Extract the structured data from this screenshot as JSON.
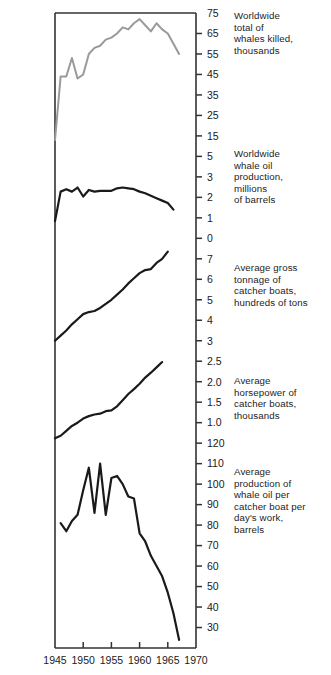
{
  "chart_data": {
    "type": "line",
    "title": "",
    "subtitle": "",
    "xlabel": "",
    "ylabel": "",
    "grid": false,
    "legend_position": "right",
    "x_axis": {
      "ticks": [
        1945,
        1950,
        1955,
        1960,
        1965,
        1970
      ],
      "range": [
        1945,
        1970
      ]
    },
    "panels": [
      {
        "name": "whales-killed",
        "caption": "Worldwide\ntotal of\nwhales killed,\nthousands",
        "color": "#9a9a9a",
        "y_ticks": [
          75,
          65,
          55,
          45,
          35,
          25,
          15
        ],
        "ylim": [
          10,
          75
        ],
        "x": [
          1945,
          1946,
          1947,
          1948,
          1949,
          1950,
          1951,
          1952,
          1953,
          1954,
          1955,
          1956,
          1957,
          1958,
          1959,
          1960,
          1961,
          1962,
          1963,
          1964,
          1965,
          1966,
          1967
        ],
        "values": [
          13,
          44,
          44,
          53,
          43,
          45,
          55,
          58,
          59,
          62,
          63,
          65,
          68,
          67,
          70,
          72,
          69,
          66,
          70,
          67,
          65,
          60,
          55
        ]
      },
      {
        "name": "whale-oil-production",
        "caption": "Worldwide\nwhale oil\nproduction,\nmillions\nof barrels",
        "color": "#1a1a1a",
        "y_ticks": [
          5,
          3,
          2,
          1,
          0
        ],
        "ylim": [
          0,
          5
        ],
        "x": [
          1945,
          1946,
          1947,
          1948,
          1949,
          1950,
          1951,
          1952,
          1953,
          1954,
          1955,
          1956,
          1957,
          1958,
          1959,
          1960,
          1961,
          1962,
          1963,
          1964,
          1965,
          1966
        ],
        "values": [
          1.05,
          2.85,
          3.0,
          2.85,
          3.1,
          2.55,
          2.95,
          2.85,
          2.9,
          2.9,
          2.9,
          3.05,
          3.1,
          3.05,
          3.0,
          2.85,
          2.75,
          2.6,
          2.45,
          2.3,
          2.15,
          1.75
        ]
      },
      {
        "name": "average-gross-tonnage",
        "caption": "Average gross\ntonnage of\ncatcher boats,\nhundreds of tons",
        "color": "#1a1a1a",
        "y_ticks": [
          7,
          6,
          5,
          4,
          3
        ],
        "ylim": [
          3,
          7.6
        ],
        "x": [
          1945,
          1946,
          1947,
          1948,
          1949,
          1950,
          1951,
          1952,
          1953,
          1954,
          1955,
          1956,
          1957,
          1958,
          1959,
          1960,
          1961,
          1962,
          1963,
          1964,
          1965
        ],
        "values": [
          3.0,
          3.25,
          3.5,
          3.8,
          4.05,
          4.3,
          4.4,
          4.45,
          4.6,
          4.8,
          5.0,
          5.25,
          5.5,
          5.8,
          6.05,
          6.3,
          6.45,
          6.5,
          6.8,
          7.0,
          7.35
        ]
      },
      {
        "name": "average-horsepower",
        "caption": "Average\nhorsepower of\ncatcher boats,\nthousands",
        "color": "#1a1a1a",
        "y_ticks": [
          3,
          2.5,
          2.0,
          1.5,
          1.0
        ],
        "ylim": [
          1.0,
          3.05
        ],
        "x": [
          1945,
          1946,
          1947,
          1948,
          1949,
          1950,
          1951,
          1952,
          1953,
          1954,
          1955,
          1956,
          1957,
          1958,
          1959,
          1960,
          1961,
          1962,
          1963,
          1964
        ],
        "values": [
          1.12,
          1.18,
          1.3,
          1.42,
          1.5,
          1.6,
          1.66,
          1.7,
          1.72,
          1.78,
          1.8,
          1.9,
          2.05,
          2.2,
          2.32,
          2.45,
          2.6,
          2.72,
          2.85,
          2.98
        ]
      },
      {
        "name": "production-per-boat-day",
        "caption": "Average\nproduction of\nwhale oil per\ncatcher boat per\nday's work,\nbarrels",
        "color": "#1a1a1a",
        "y_ticks": [
          120,
          110,
          100,
          90,
          80,
          70,
          60,
          50,
          40,
          30
        ],
        "ylim": [
          30,
          125
        ],
        "x": [
          1946,
          1947,
          1948,
          1949,
          1950,
          1951,
          1952,
          1953,
          1954,
          1955,
          1956,
          1957,
          1958,
          1959,
          1960,
          1961,
          1962,
          1963,
          1964,
          1965,
          1966,
          1967
        ],
        "values": [
          91,
          87,
          92,
          95,
          107,
          118,
          96,
          120,
          95,
          113,
          114,
          110,
          104,
          103,
          86,
          82,
          75,
          70,
          65,
          57,
          47,
          34
        ]
      }
    ]
  },
  "axis": {
    "tick_labels": [
      "75",
      "65",
      "55",
      "45",
      "35",
      "25",
      "15",
      "5",
      "3",
      "2",
      "1",
      "0",
      "7",
      "6",
      "5",
      "4",
      "3",
      "2.5",
      "2.0",
      "1.5",
      "1.0",
      "120",
      "110",
      "100",
      "90",
      "80",
      "70",
      "60",
      "50",
      "40",
      "30"
    ],
    "x_tick_labels": [
      "1945",
      "1950",
      "1955",
      "1960",
      "1965",
      "1970"
    ]
  },
  "captions": [
    "Worldwide\ntotal of\nwhales killed,\nthousands",
    "Worldwide\nwhale oil\nproduction,\nmillions\nof barrels",
    "Average gross\ntonnage of\ncatcher boats,\nhundreds of tons",
    "Average\nhorsepower of\ncatcher boats,\nthousands",
    "Average\nproduction of\nwhale oil per\ncatcher boat per\nday's work,\nbarrels"
  ]
}
